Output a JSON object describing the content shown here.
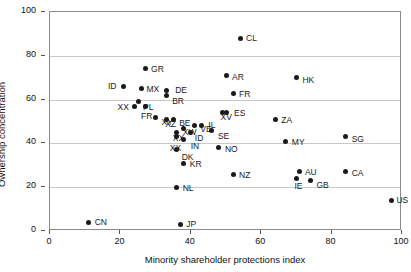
{
  "chart_data": {
    "type": "scatter",
    "title": "",
    "xlabel": "Minority shareholder protections index",
    "ylabel": "Ownership concentration",
    "xlim": [
      0,
      100
    ],
    "ylim": [
      0,
      100
    ],
    "xticks": [
      0,
      20,
      40,
      60,
      80,
      100
    ],
    "yticks": [
      0,
      20,
      40,
      60,
      80,
      100
    ],
    "grid": "horizontal",
    "legend": "none",
    "marker_color": "#1a1a1a",
    "grid_color": "#c8c8c8",
    "axis_color": "#8a8a8a",
    "points": [
      {
        "label": "CN",
        "x": 11,
        "y": 4,
        "lx": 6,
        "ly": -4
      },
      {
        "label": "ID",
        "x": 21,
        "y": 66,
        "lx": -16,
        "ly": -4
      },
      {
        "label": "XX",
        "x": 24,
        "y": 57,
        "lx": -17,
        "ly": -3
      },
      {
        "label": "PL",
        "x": 25,
        "y": 59,
        "lx": 5,
        "ly": 1
      },
      {
        "label": "GR",
        "x": 27,
        "y": 74,
        "lx": 6,
        "ly": -4
      },
      {
        "label": "MX",
        "x": 26,
        "y": 65,
        "lx": 5,
        "ly": -4
      },
      {
        "label": "FR",
        "x": 27,
        "y": 57,
        "lx": -4,
        "ly": 6
      },
      {
        "label": "XY",
        "x": 30,
        "y": 52,
        "lx": 6,
        "ly": 1
      },
      {
        "label": "BR",
        "x": 33,
        "y": 62,
        "lx": 6,
        "ly": 2
      },
      {
        "label": "DE",
        "x": 33,
        "y": 64,
        "lx": 9,
        "ly": -5
      },
      {
        "label": "XZ",
        "x": 33,
        "y": 51,
        "lx": -1,
        "ly": 1
      },
      {
        "label": "BE",
        "x": 35,
        "y": 51,
        "lx": 6,
        "ly": 0
      },
      {
        "label": "XX",
        "x": 36,
        "y": 45,
        "lx": -4,
        "ly": 2
      },
      {
        "label": "XX",
        "x": 36,
        "y": 43,
        "lx": -7,
        "ly": 7
      },
      {
        "label": "NL",
        "x": 36,
        "y": 20,
        "lx": 6,
        "ly": -3
      },
      {
        "label": "DK",
        "x": 36,
        "y": 37,
        "lx": 5,
        "ly": 3
      },
      {
        "label": "JP",
        "x": 37,
        "y": 3,
        "lx": 6,
        "ly": -4
      },
      {
        "label": "KR",
        "x": 38,
        "y": 31,
        "lx": 6,
        "ly": -3
      },
      {
        "label": "IN",
        "x": 38,
        "y": 42,
        "lx": 7,
        "ly": 3
      },
      {
        "label": "XW",
        "x": 38,
        "y": 47,
        "lx": -1,
        "ly": 0
      },
      {
        "label": "ID",
        "x": 40,
        "y": 45,
        "lx": 4,
        "ly": 2
      },
      {
        "label": "VE",
        "x": 41,
        "y": 48,
        "lx": 6,
        "ly": -1
      },
      {
        "label": "IL",
        "x": 43,
        "y": 48,
        "lx": 7,
        "ly": -5
      },
      {
        "label": "SE",
        "x": 46,
        "y": 46,
        "lx": 6,
        "ly": 2
      },
      {
        "label": "NO",
        "x": 48,
        "y": 38,
        "lx": 6,
        "ly": -3
      },
      {
        "label": "ES",
        "x": 50,
        "y": 54,
        "lx": 8,
        "ly": -4
      },
      {
        "label": "XV",
        "x": 49,
        "y": 54,
        "lx": -2,
        "ly": 0
      },
      {
        "label": "AR",
        "x": 50,
        "y": 71,
        "lx": 6,
        "ly": -3
      },
      {
        "label": "FR",
        "x": 52,
        "y": 63,
        "lx": 6,
        "ly": -3
      },
      {
        "label": "NZ",
        "x": 52,
        "y": 26,
        "lx": 6,
        "ly": -3
      },
      {
        "label": "CL",
        "x": 54,
        "y": 88,
        "lx": 6,
        "ly": -4
      },
      {
        "label": "ZA",
        "x": 64,
        "y": 51,
        "lx": 6,
        "ly": -3
      },
      {
        "label": "MY",
        "x": 67,
        "y": 41,
        "lx": 6,
        "ly": -3
      },
      {
        "label": "HK",
        "x": 70,
        "y": 70,
        "lx": 6,
        "ly": -2
      },
      {
        "label": "IE",
        "x": 70,
        "y": 24,
        "lx": -2,
        "ly": 4
      },
      {
        "label": "AU",
        "x": 71,
        "y": 27,
        "lx": 5,
        "ly": -4
      },
      {
        "label": "GB",
        "x": 74,
        "y": 23,
        "lx": 6,
        "ly": 0
      },
      {
        "label": "SG",
        "x": 84,
        "y": 43,
        "lx": 6,
        "ly": -2
      },
      {
        "label": "CA",
        "x": 84,
        "y": 27,
        "lx": 6,
        "ly": -3
      },
      {
        "label": "US",
        "x": 97,
        "y": 14,
        "lx": 5,
        "ly": -4
      }
    ]
  }
}
